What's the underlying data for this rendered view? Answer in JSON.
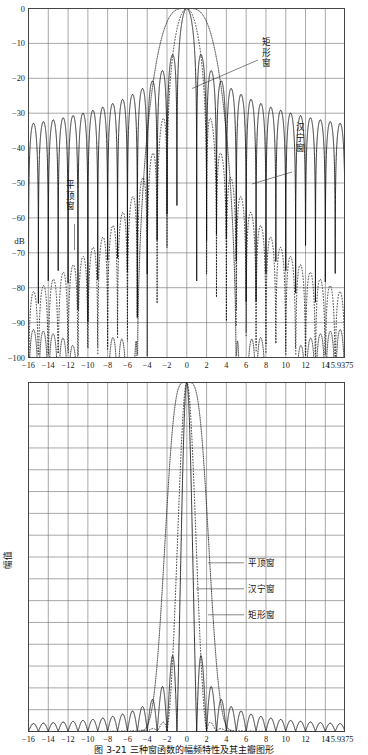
{
  "figure": {
    "caption": "图 3-21  三种窗函数的幅频特性及其主瓣图形",
    "caption_visible_partial": true
  },
  "charts": [
    {
      "id": "top",
      "type": "line",
      "title": "",
      "xlabel": "",
      "ylabel": "dB",
      "xlim": [
        -16,
        15.9375
      ],
      "ylim": [
        -100,
        0
      ],
      "xticks": [
        "-16",
        "-14",
        "-12",
        "-10",
        "-8",
        "-6",
        "-4",
        "-2",
        "0",
        "2",
        "4",
        "6",
        "8",
        "10",
        "12",
        "14",
        "15.9375"
      ],
      "xtickvals": [
        -16,
        -14,
        -12,
        -10,
        -8,
        -6,
        -4,
        -2,
        0,
        2,
        4,
        6,
        8,
        10,
        12,
        14,
        15.9375
      ],
      "yticks": [
        "0",
        "-10",
        "-20",
        "-30",
        "-40",
        "-50",
        "-60",
        "-70",
        "-80",
        "-90",
        "-100"
      ],
      "ytickvals": [
        0,
        -10,
        -20,
        -30,
        -40,
        -50,
        -60,
        -70,
        -80,
        -90,
        -100
      ],
      "grid": true,
      "legend_position": "inline-annotations",
      "annotations": [
        {
          "label": "矩形窗",
          "orientation": "horizontal",
          "x_px": 262,
          "y_px": 45,
          "leader_to_x_px": 192,
          "leader_to_y_px": 88
        },
        {
          "label": "汉宁窗",
          "orientation": "vertical",
          "x_px": 296,
          "y_px": 130,
          "leader_to_x_px": 252,
          "leader_to_y_px": 182
        },
        {
          "label": "平顶窗",
          "orientation": "vertical",
          "x_px": 70,
          "y_px": 188,
          "leader_to_x_px": 78,
          "leader_to_y_px": 246
        }
      ],
      "series": [
        {
          "name": "矩形窗",
          "style": "solid",
          "window": "rectangular",
          "peak_sidelobe_db": -13.3,
          "mainlobe_halfwidth_bins": 1.0
        },
        {
          "name": "汉宁窗",
          "style": "dashed",
          "window": "hanning",
          "peak_sidelobe_db": -31.5,
          "mainlobe_halfwidth_bins": 2.0
        },
        {
          "name": "平顶窗",
          "style": "dotted",
          "window": "flattop",
          "peak_sidelobe_db": -68.0,
          "mainlobe_halfwidth_bins": 3.4
        }
      ]
    },
    {
      "id": "bottom",
      "type": "line",
      "title": "",
      "xlabel": "",
      "ylabel": "幅值",
      "xlim": [
        -16,
        15.9375
      ],
      "ylim": [
        0,
        1
      ],
      "xticks": [
        "-16",
        "-14",
        "-12",
        "-10",
        "-8",
        "-6",
        "-4",
        "-2",
        "0",
        "2",
        "4",
        "6",
        "8",
        "10",
        "12",
        "14",
        "15.9375"
      ],
      "xtickvals": [
        -16,
        -14,
        -12,
        -10,
        -8,
        -6,
        -4,
        -2,
        0,
        2,
        4,
        6,
        8,
        10,
        12,
        14,
        15.9375
      ],
      "yticks": [],
      "grid": true,
      "grid_rows": 16,
      "legend_position": "inline-annotations",
      "annotations": [
        {
          "label": "平顶窗",
          "orientation": "horizontal",
          "x_px": 248,
          "y_px": 566,
          "leader_to_x_px": 208,
          "leader_to_y_px": 566
        },
        {
          "label": "汉宁窗",
          "orientation": "horizontal",
          "x_px": 248,
          "y_px": 592,
          "leader_to_x_px": 196,
          "leader_to_y_px": 592
        },
        {
          "label": "矩形窗",
          "orientation": "horizontal",
          "x_px": 248,
          "y_px": 618,
          "leader_to_x_px": 208,
          "leader_to_y_px": 618
        }
      ],
      "series": [
        {
          "name": "矩形窗",
          "style": "solid",
          "window": "rectangular"
        },
        {
          "name": "汉宁窗",
          "style": "dashed",
          "window": "hanning"
        },
        {
          "name": "平顶窗",
          "style": "dotted",
          "window": "flattop"
        }
      ]
    }
  ],
  "chart_data": {
    "type": "line",
    "title": "三种窗函数的幅频特性",
    "charts": [
      {
        "id": "magnitude-db",
        "type": "line",
        "ylabel": "dB",
        "xlabel": "",
        "xlim": [
          -16,
          15.9375
        ],
        "ylim": [
          -100,
          0
        ],
        "xticks": [
          -16,
          -14,
          -12,
          -10,
          -8,
          -6,
          -4,
          -2,
          0,
          2,
          4,
          6,
          8,
          10,
          12,
          14,
          15.9375
        ],
        "yticks": [
          0,
          -10,
          -20,
          -30,
          -40,
          -50,
          -60,
          -70,
          -80,
          -90,
          -100
        ],
        "grid": true,
        "series": [
          {
            "name": "矩形窗",
            "style": "solid",
            "description": "Rectangular window Dirichlet kernel, sin(pi x)/(pi x)",
            "key_points": [
              {
                "x": 0,
                "y": 0
              },
              {
                "x": 1.43,
                "y": -13.3
              },
              {
                "x": 2.46,
                "y": -17.8
              },
              {
                "x": 3.47,
                "y": -20.8
              },
              {
                "x": 4.48,
                "y": -23.0
              },
              {
                "x": 5.48,
                "y": -24.8
              },
              {
                "x": 6.48,
                "y": -26.2
              },
              {
                "x": 8.49,
                "y": -28.5
              },
              {
                "x": 10.49,
                "y": -30.3
              },
              {
                "x": 12.49,
                "y": -31.7
              },
              {
                "x": 14.49,
                "y": -33.0
              }
            ]
          },
          {
            "name": "汉宁窗",
            "style": "dashed",
            "description": "Hanning (Hann) window spectrum, mainlobe 4 bins wide",
            "key_points": [
              {
                "x": 0,
                "y": 0
              },
              {
                "x": 2.36,
                "y": -31.5
              },
              {
                "x": 3.39,
                "y": -41.5
              },
              {
                "x": 4.4,
                "y": -47.5
              },
              {
                "x": 5.4,
                "y": -52.0
              },
              {
                "x": 6.41,
                "y": -55.5
              },
              {
                "x": 8.41,
                "y": -61.0
              },
              {
                "x": 10.41,
                "y": -65.0
              },
              {
                "x": 12.41,
                "y": -68.3
              },
              {
                "x": 14.41,
                "y": -71.0
              }
            ]
          },
          {
            "name": "平顶窗",
            "style": "dotted",
            "description": "Flat-top window spectrum, very low sidelobes ~ -68 to -95 dB",
            "key_points": [
              {
                "x": 0,
                "y": 0
              },
              {
                "x": 4.2,
                "y": -68.0
              },
              {
                "x": 5.4,
                "y": -72.0
              },
              {
                "x": 6.5,
                "y": -78.0
              },
              {
                "x": 8.5,
                "y": -85.0
              },
              {
                "x": 10.5,
                "y": -90.0
              },
              {
                "x": 12.5,
                "y": -93.0
              },
              {
                "x": 14.5,
                "y": -95.0
              }
            ]
          }
        ]
      },
      {
        "id": "magnitude-linear",
        "type": "line",
        "ylabel": "幅值",
        "xlabel": "",
        "xlim": [
          -16,
          15.9375
        ],
        "ylim": [
          0,
          1
        ],
        "xticks": [
          -16,
          -14,
          -12,
          -10,
          -8,
          -6,
          -4,
          -2,
          0,
          2,
          4,
          6,
          8,
          10,
          12,
          14,
          15.9375
        ],
        "grid": true,
        "series": [
          {
            "name": "矩形窗",
            "style": "solid",
            "key_points": [
              {
                "x": 0,
                "y": 1.0
              },
              {
                "x": 1.43,
                "y": 0.217
              },
              {
                "x": 2.46,
                "y": 0.128
              },
              {
                "x": 3.47,
                "y": 0.091
              },
              {
                "x": 4.48,
                "y": 0.071
              },
              {
                "x": 6.48,
                "y": 0.049
              },
              {
                "x": 10.49,
                "y": 0.03
              },
              {
                "x": 14.49,
                "y": 0.022
              }
            ]
          },
          {
            "name": "汉宁窗",
            "style": "dashed",
            "key_points": [
              {
                "x": 0,
                "y": 1.0
              },
              {
                "x": 2.36,
                "y": 0.027
              },
              {
                "x": 3.39,
                "y": 0.0084
              },
              {
                "x": 4.4,
                "y": 0.0042
              }
            ]
          },
          {
            "name": "平顶窗",
            "style": "dotted",
            "key_points": [
              {
                "x": 0,
                "y": 1.0
              },
              {
                "x": 2.0,
                "y": 0.62
              },
              {
                "x": 3.0,
                "y": 0.2
              },
              {
                "x": 4.2,
                "y": 0.0004
              }
            ]
          }
        ]
      }
    ]
  }
}
